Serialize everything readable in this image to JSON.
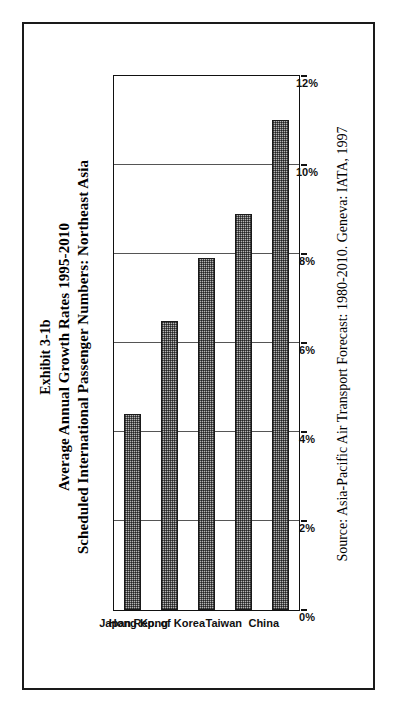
{
  "exhibit": {
    "title_line_1": "Exhibit 3-1b",
    "title_line_2": "Average Annual Growth Rates 1995-2010",
    "title_line_3": "Scheduled International Passenger Numbers: Northeast Asia",
    "source": "Source: Asia-Pacific Air Transport Forecast: 1980-2010. Geneva: IATA, 1997"
  },
  "chart_data": {
    "type": "bar",
    "orientation": "vertical-printed-sideways",
    "xlabel": "",
    "ylabel": "",
    "categories": [
      "Japan",
      "Hong Kong",
      "Rep. of Korea",
      "Taiwan",
      "China"
    ],
    "values": [
      4.4,
      6.5,
      7.9,
      8.9,
      11.0
    ],
    "value_suffix": "%",
    "ylim": [
      0,
      12
    ],
    "tick_values": [
      0,
      2,
      4,
      6,
      8,
      10,
      12
    ],
    "tick_labels": [
      "0%",
      "2%",
      "4%",
      "6%",
      "8%",
      "10%",
      "12%"
    ],
    "grid": true,
    "legend": "none",
    "bar_fill": "#b5b5b5",
    "bar_border": "#1a1a1a",
    "gridline_color": "#555555",
    "axis_color": "#111111",
    "background": "#ffffff"
  }
}
